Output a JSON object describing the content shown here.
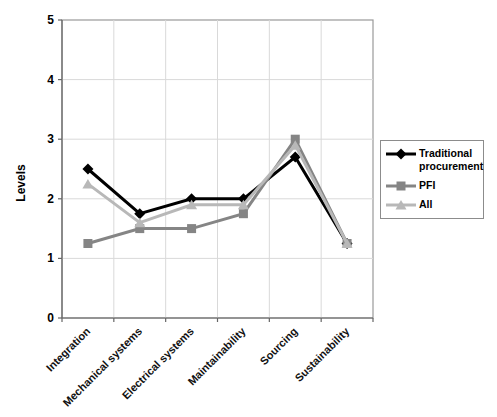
{
  "chart_data": {
    "type": "line",
    "title": "",
    "ylabel": "Levels",
    "xlabel": "",
    "ylim": [
      0,
      5
    ],
    "yticks": [
      0,
      1,
      2,
      3,
      4,
      5
    ],
    "grid": true,
    "legend_position": "right",
    "categories": [
      "Integration",
      "Mechanical systems",
      "Electrical systems",
      "Maintainability",
      "Sourcing",
      "Sustainability"
    ],
    "series": [
      {
        "name": "Traditional procurement",
        "marker": "diamond",
        "color": "#000000",
        "values": [
          2.5,
          1.75,
          2.0,
          2.0,
          2.7,
          1.25
        ]
      },
      {
        "name": "PFI",
        "marker": "square",
        "color": "#858585",
        "values": [
          1.25,
          1.5,
          1.5,
          1.75,
          3.0,
          1.25
        ]
      },
      {
        "name": "All",
        "marker": "triangle",
        "color": "#b8b8b8",
        "values": [
          2.25,
          1.6,
          1.9,
          1.9,
          2.9,
          1.25
        ]
      }
    ]
  },
  "colors": {
    "background": "#ffffff",
    "plot_border": "#999999",
    "axis": "#666666",
    "gridline": "#d9d9d9",
    "text": "#000000"
  }
}
